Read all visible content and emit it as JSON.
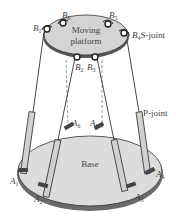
{
  "diagram": {
    "type": "Stewart platform (6-DOF parallel mechanism)",
    "platform_label_line1": "Moving",
    "platform_label_line2": "platform",
    "base_label": "Base",
    "s_joint_label": "S-joint",
    "p_joint_label": "P-joint",
    "top_joints": [
      {
        "id": "B1",
        "letter": "B",
        "sub": "1"
      },
      {
        "id": "B6",
        "letter": "B",
        "sub": "6"
      },
      {
        "id": "B5",
        "letter": "B",
        "sub": "5"
      },
      {
        "id": "B4",
        "letter": "B",
        "sub": "4"
      },
      {
        "id": "B2",
        "letter": "B",
        "sub": "2"
      },
      {
        "id": "B3",
        "letter": "B",
        "sub": "3"
      }
    ],
    "base_joints": [
      {
        "id": "A6",
        "letter": "A",
        "sub": "6"
      },
      {
        "id": "A5",
        "letter": "A",
        "sub": "5"
      },
      {
        "id": "A1",
        "letter": "A",
        "sub": "1"
      },
      {
        "id": "A2",
        "letter": "A",
        "sub": "2"
      },
      {
        "id": "A3",
        "letter": "A",
        "sub": "3"
      },
      {
        "id": "A4",
        "letter": "A",
        "sub": "4"
      }
    ],
    "colors": {
      "platform_fill": "#d4d4d4",
      "base_fill": "#dcdcdc",
      "line": "#333333"
    }
  }
}
